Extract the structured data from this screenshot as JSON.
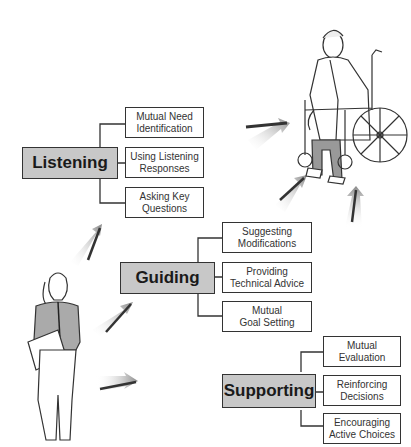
{
  "diagram": {
    "target_figure": "patient-in-wheelchair",
    "source_figure": "healthcare-worker-with-clipboard",
    "groups": [
      {
        "label": "Listening",
        "items": [
          "Mutual Need\nIdentification",
          "Using Listening\nResponses",
          "Asking Key\nQuestions"
        ]
      },
      {
        "label": "Guiding",
        "items": [
          "Suggesting\nModifications",
          "Providing\nTechnical Advice",
          "Mutual\nGoal Setting"
        ]
      },
      {
        "label": "Supporting",
        "items": [
          "Mutual\nEvaluation",
          "Reinforcing\nDecisions",
          "Encouraging\nActive Choices"
        ]
      }
    ]
  }
}
